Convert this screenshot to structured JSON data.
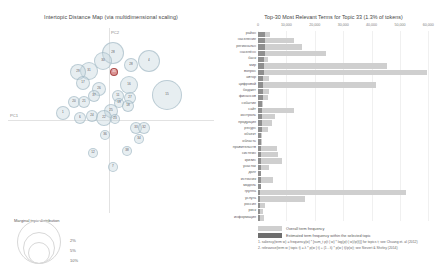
{
  "left_panel": {
    "title": "Intertopic Distance Map (via multidimensional scaling)",
    "axis_x_label": "PC1",
    "axis_y_label": "PC2",
    "legend": {
      "title": "Marginal topic distribution",
      "ticks": [
        "2%",
        "5%",
        "10%"
      ]
    }
  },
  "right_panel": {
    "title": "Top-30 Most Relevant Terms for Topic 33 (1.3% of tokens)",
    "legend": {
      "overall_label": "Overall term frequency",
      "selected_label": "Estimated term frequency within the selected topic",
      "footnote_1": "1. saliency(term w) = frequency(w) * [sum_t p(t | w) * log(p(t | w)/p(t))] for topics t; see Chuang et. al (2012)",
      "footnote_2": "2. relevance(term w | topic t) = λ * p(w | t) + (1 - λ) * p(w | t)/p(w); see Sievert & Shirley (2014)"
    }
  },
  "chart_data": {
    "type": "bar",
    "title": "Top-30 Most Relevant Terms for Topic 33 (1.3% of tokens)",
    "xlabel": "",
    "ylabel": "",
    "xlim": [
      0,
      62000
    ],
    "grid": true,
    "orientation": "horizontal",
    "legend_position": "bottom",
    "xticks": [
      0,
      10000,
      20000,
      30000,
      40000,
      50000,
      60000
    ],
    "xtick_labels": [
      "0",
      "10,000",
      "20,000",
      "30,000",
      "40,000",
      "50,000",
      "60,000"
    ],
    "categories": [
      "район",
      "население",
      "региональн",
      "населённ",
      "банк",
      "мир",
      "вопрос",
      "автор",
      "цифровой",
      "бюджет",
      "финансов",
      "событие",
      "сайт",
      "контроль",
      "продукция",
      "ресурс",
      "объект",
      "область",
      "правительств",
      "системн",
      "кризис",
      "участок",
      "долг",
      "источник",
      "модель",
      "группа",
      "услуга",
      "россия",
      "риск",
      "информация"
    ],
    "series": [
      {
        "name": "Overall term frequency",
        "values": [
          4400,
          12700,
          15500,
          24000,
          3400,
          45500,
          59500,
          4000,
          41500,
          3800,
          3600,
          1600,
          12800,
          6000,
          4900,
          3400,
          1500,
          1300,
          6600,
          7000,
          8500,
          4000,
          1200,
          5400,
          1100,
          52000,
          16500,
          2400,
          1900,
          2000
        ]
      },
      {
        "name": "Estimated term frequency within the selected topic",
        "values": [
          2600,
          2500,
          2400,
          2300,
          2100,
          2000,
          1950,
          1900,
          1850,
          1800,
          1750,
          1500,
          1450,
          1400,
          1350,
          1300,
          1200,
          1150,
          1100,
          1080,
          1050,
          1000,
          950,
          930,
          900,
          880,
          860,
          840,
          820,
          800
        ]
      }
    ]
  },
  "bubbles": [
    {
      "label": "28",
      "x": 34,
      "y": 8,
      "r": 11,
      "selected": false
    },
    {
      "label": "30",
      "x": 26,
      "y": 18,
      "r": 9,
      "selected": false
    },
    {
      "label": "4",
      "x": 70,
      "y": 16,
      "r": 11,
      "selected": false
    },
    {
      "label": "28",
      "x": 56,
      "y": 24,
      "r": 7,
      "selected": false
    },
    {
      "label": "31",
      "x": 12,
      "y": 28,
      "r": 9,
      "selected": false
    },
    {
      "label": "29",
      "x": 2,
      "y": 30,
      "r": 8,
      "selected": false
    },
    {
      "label": "35",
      "x": 42,
      "y": 34,
      "r": 4,
      "selected": true
    },
    {
      "label": "16",
      "x": 52,
      "y": 42,
      "r": 9,
      "selected": false
    },
    {
      "label": "17",
      "x": 8,
      "y": 42,
      "r": 7,
      "selected": false
    },
    {
      "label": "15",
      "x": 84,
      "y": 46,
      "r": 15,
      "selected": false
    },
    {
      "label": "26",
      "x": 24,
      "y": 48,
      "r": 7,
      "selected": false
    },
    {
      "label": "37",
      "x": 20,
      "y": 56,
      "r": 6,
      "selected": false
    },
    {
      "label": "11",
      "x": 44,
      "y": 56,
      "r": 6,
      "selected": false
    },
    {
      "label": "27",
      "x": 56,
      "y": 58,
      "r": 6,
      "selected": false
    },
    {
      "label": "20",
      "x": 0,
      "y": 62,
      "r": 6,
      "selected": false
    },
    {
      "label": "21",
      "x": 10,
      "y": 62,
      "r": 6,
      "selected": false
    },
    {
      "label": "19",
      "x": 46,
      "y": 64,
      "r": 5,
      "selected": false
    },
    {
      "label": "18",
      "x": 54,
      "y": 66,
      "r": 6,
      "selected": false
    },
    {
      "label": "1",
      "x": -12,
      "y": 72,
      "r": 7,
      "selected": false
    },
    {
      "label": "25",
      "x": 36,
      "y": 70,
      "r": 7,
      "selected": false
    },
    {
      "label": "6",
      "x": 6,
      "y": 78,
      "r": 6,
      "selected": false
    },
    {
      "label": "24",
      "x": 18,
      "y": 76,
      "r": 6,
      "selected": false
    },
    {
      "label": "22",
      "x": 28,
      "y": 76,
      "r": 8,
      "selected": false
    },
    {
      "label": "23",
      "x": 42,
      "y": 80,
      "r": 5,
      "selected": false
    },
    {
      "label": "33",
      "x": 62,
      "y": 88,
      "r": 6,
      "selected": false
    },
    {
      "label": "32",
      "x": 70,
      "y": 88,
      "r": 6,
      "selected": false
    },
    {
      "label": "36",
      "x": 32,
      "y": 96,
      "r": 5,
      "selected": false
    },
    {
      "label": "34",
      "x": 66,
      "y": 100,
      "r": 5,
      "selected": false
    },
    {
      "label": "12",
      "x": 20,
      "y": 114,
      "r": 5,
      "selected": false
    },
    {
      "label": "38",
      "x": 54,
      "y": 112,
      "r": 5,
      "selected": false
    },
    {
      "label": "7",
      "x": 40,
      "y": 128,
      "r": 5,
      "selected": false
    }
  ]
}
